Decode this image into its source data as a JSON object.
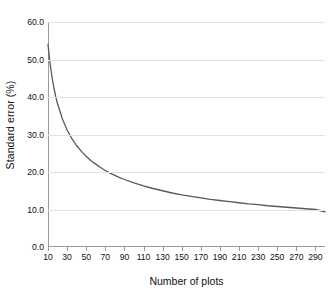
{
  "chart_data": {
    "type": "line",
    "title": "",
    "xlabel": "Number of plots",
    "ylabel": "Standard error (%)",
    "xlim": [
      10,
      300
    ],
    "ylim": [
      0.0,
      60.0
    ],
    "grid": true,
    "legend": false,
    "line_color": "#595959",
    "grid_color": "#e2e2e2",
    "axis_color": "#9a9a9a",
    "background_color": "#ffffff",
    "xticks": [
      10,
      30,
      50,
      70,
      90,
      110,
      130,
      150,
      170,
      190,
      210,
      230,
      250,
      270,
      290
    ],
    "xtick_labels": [
      "10",
      "30",
      "50",
      "70",
      "90",
      "110",
      "130",
      "150",
      "170",
      "190",
      "210",
      "230",
      "250",
      "270",
      "290"
    ],
    "yticks": [
      0.0,
      10.0,
      20.0,
      30.0,
      40.0,
      50.0,
      60.0
    ],
    "ytick_labels": [
      "0.0",
      "10.0",
      "20.0",
      "30.0",
      "40.0",
      "50.0",
      "60.0"
    ],
    "series": [
      {
        "name": "Standard error",
        "x": [
          10,
          12,
          14,
          16,
          18,
          20,
          25,
          30,
          35,
          40,
          45,
          50,
          55,
          60,
          65,
          70,
          75,
          80,
          85,
          90,
          100,
          110,
          120,
          130,
          140,
          150,
          160,
          170,
          180,
          190,
          200,
          210,
          220,
          230,
          240,
          250,
          260,
          270,
          280,
          290,
          300
        ],
        "y": [
          54.0,
          49.3,
          45.6,
          42.7,
          40.2,
          38.2,
          34.2,
          31.2,
          28.9,
          27.0,
          25.5,
          24.2,
          23.0,
          22.1,
          21.2,
          20.4,
          19.7,
          19.1,
          18.5,
          18.0,
          17.1,
          16.3,
          15.6,
          15.0,
          14.4,
          13.9,
          13.5,
          13.1,
          12.7,
          12.4,
          12.1,
          11.8,
          11.5,
          11.3,
          11.0,
          10.8,
          10.6,
          10.4,
          10.2,
          10.0,
          9.4
        ]
      }
    ]
  },
  "axes": {
    "ylabel_text": "Standard error (%)",
    "xlabel_text": "Number of plots"
  }
}
